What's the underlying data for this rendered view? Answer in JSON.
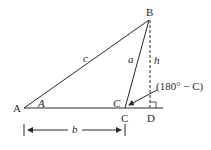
{
  "diagram": {
    "type": "oblique-triangle-altitude",
    "vertices": {
      "A": "A",
      "B": "B",
      "C": "C",
      "D": "D"
    },
    "sides": {
      "c": "c",
      "a": "a",
      "b": "b"
    },
    "altitude": "h",
    "angles": {
      "A": "A",
      "C": "C",
      "exterior": "(180° − C)"
    },
    "colors": {
      "line": "#2a2a2a",
      "background": "#ffffff"
    }
  }
}
